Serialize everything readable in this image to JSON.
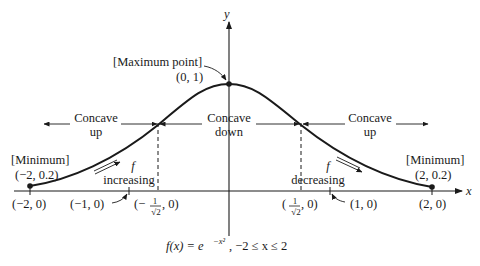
{
  "axes": {
    "x_label": "x",
    "y_label": "y"
  },
  "points": {
    "maximum": {
      "title": "[Maximum point]",
      "coords": "(0, 1)"
    },
    "min_left": {
      "title": "[Minimum]",
      "coords": "(−2, 0.2)"
    },
    "min_right": {
      "title": "[Minimum]",
      "coords": "(2, 0.2)"
    }
  },
  "x_ticks": {
    "neg2": "(−2, 0)",
    "neg1": "(−1, 0)",
    "neg_inflect_pre": "(−",
    "neg_inflect_post": ", 0)",
    "pos_inflect_pre": "(",
    "pos_inflect_post": ", 0)",
    "frac_num": "1",
    "frac_den": "√2",
    "pos1": "(1, 0)",
    "pos2": "(2, 0)"
  },
  "regions": {
    "left": {
      "line1": "Concave",
      "line2": "up"
    },
    "middle": {
      "line1": "Concave",
      "line2": "down"
    },
    "right": {
      "line1": "Concave",
      "line2": "up"
    }
  },
  "monotonic": {
    "increasing": {
      "symbol": "f",
      "text": "increasing"
    },
    "decreasing": {
      "symbol": "f",
      "text": "decreasing"
    }
  },
  "caption": {
    "fx": "f(x) = e",
    "exponent": "−x²",
    "domain": ", −2 ≤ x ≤ 2"
  }
}
